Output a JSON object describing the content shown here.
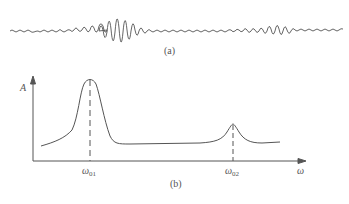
{
  "figure": {
    "panel_a": {
      "label": "(a)",
      "description": "time-domain vibration signal with two wave packets"
    },
    "panel_b": {
      "label": "(b)",
      "y_axis_label": "A",
      "x_axis_label": "ω",
      "peaks": [
        {
          "label_main": "ω",
          "label_sub": "01",
          "relative_height": "high"
        },
        {
          "label_main": "ω",
          "label_sub": "02",
          "relative_height": "low"
        }
      ]
    },
    "colors": {
      "line": "#555555",
      "background": "#ffffff"
    }
  }
}
